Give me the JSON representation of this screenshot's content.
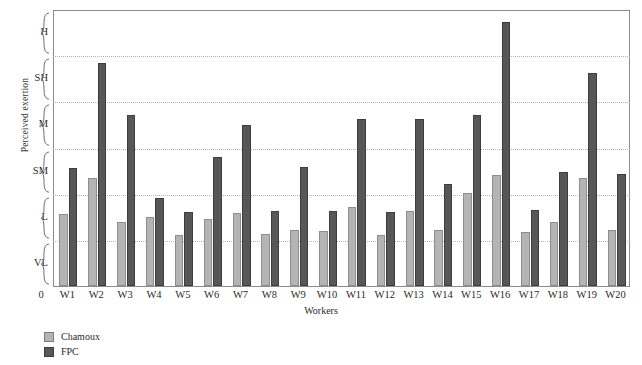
{
  "chart_data": {
    "type": "bar",
    "title": "",
    "xlabel": "Workers",
    "ylabel": "Perceived exertion",
    "origin_label": "0",
    "grid": true,
    "legend_position": "bottom-left",
    "categories": [
      "W1",
      "W2",
      "W3",
      "W4",
      "W5",
      "W6",
      "W7",
      "W8",
      "W9",
      "W10",
      "W11",
      "W12",
      "W13",
      "W14",
      "W15",
      "W16",
      "W17",
      "W18",
      "W19",
      "W20"
    ],
    "y_categories": [
      "VL",
      "L",
      "SM",
      "M",
      "SH",
      "H"
    ],
    "y_category_names": [
      "Very Low",
      "Low",
      "Somewhat Moderate",
      "Moderate",
      "Somewhat High",
      "High"
    ],
    "ylim": [
      0,
      6
    ],
    "series": [
      {
        "name": "Chamoux",
        "color": "#b4b4b4",
        "values": [
          1.55,
          2.35,
          1.38,
          1.5,
          1.1,
          1.45,
          1.58,
          1.12,
          1.22,
          1.2,
          1.72,
          1.1,
          1.62,
          1.22,
          2.02,
          2.4,
          1.18,
          1.38,
          2.35,
          1.22
        ]
      },
      {
        "name": "FPC",
        "color": "#575757",
        "values": [
          2.55,
          4.82,
          3.7,
          1.9,
          1.6,
          2.8,
          3.48,
          1.62,
          2.58,
          1.62,
          3.62,
          1.6,
          3.62,
          2.2,
          3.7,
          5.72,
          1.65,
          2.48,
          4.62,
          2.42
        ]
      }
    ]
  },
  "legend": {
    "items": [
      {
        "label": "Chamoux",
        "color": "#b4b4b4"
      },
      {
        "label": "FPC",
        "color": "#575757"
      }
    ]
  }
}
